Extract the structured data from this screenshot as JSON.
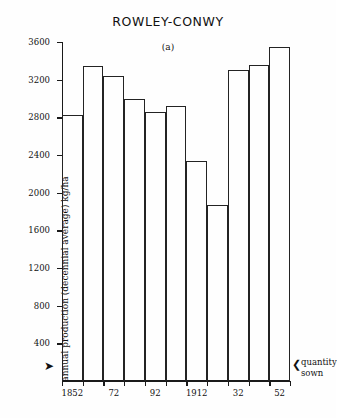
{
  "chart_data": {
    "type": "bar",
    "title": "ROWLEY-CONWY",
    "panel_label": "(a)",
    "xlabel": "",
    "ylabel": "annual production (decennial average) kg/ha",
    "ylim": [
      0,
      3600
    ],
    "yticks": [
      400,
      800,
      1200,
      1600,
      2000,
      2400,
      2800,
      3200,
      3600
    ],
    "ytick_labels": [
      "400",
      "800",
      "1200",
      "1600",
      "2000",
      "2400",
      "2800",
      "3200",
      "3600"
    ],
    "grid": false,
    "legend": null,
    "categories": [
      "1852",
      "1862",
      "1872",
      "1882",
      "1892",
      "1902",
      "1912",
      "1922",
      "1932",
      "1942",
      "1952"
    ],
    "xtick_labels": [
      "1852",
      "72",
      "92",
      "1912",
      "32",
      "52"
    ],
    "xtick_indices": [
      0,
      2,
      4,
      6,
      8,
      10
    ],
    "values": [
      2820,
      3340,
      3240,
      3000,
      2860,
      2920,
      2340,
      1870,
      3300,
      3360,
      3550
    ],
    "annotations": [
      {
        "text": "quantity sown",
        "marker_left": "➤",
        "marker_right": "❮"
      }
    ],
    "colors": {
      "bar_stroke": "#232323",
      "bar_fill": "transparent",
      "axis": "#1a1a1a",
      "text": "#111111",
      "background": "#fefefe"
    }
  },
  "annotation": {
    "quantity_sown_line1": "quantity",
    "quantity_sown_line2": "sown",
    "arrow_left": "➤",
    "arrow_right": "❮"
  }
}
